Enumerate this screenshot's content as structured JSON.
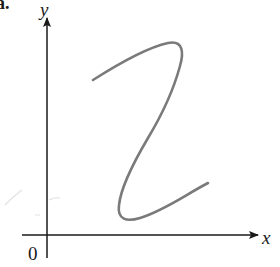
{
  "figure": {
    "panel_label": "a.",
    "axes": {
      "x_label": "x",
      "y_label": "y",
      "origin_label": "0"
    },
    "colors": {
      "axis": "#1a1a1a",
      "curve": "#7a7a7a",
      "background": "#ffffff"
    },
    "curve": {
      "description": "S-shaped curve that is not a function of x (fails vertical line test)",
      "path_points": [
        [
          93,
          80
        ],
        [
          170,
          42
        ],
        [
          180,
          60
        ],
        [
          155,
          130
        ],
        [
          125,
          180
        ],
        [
          122,
          218
        ],
        [
          208,
          183
        ]
      ]
    }
  }
}
